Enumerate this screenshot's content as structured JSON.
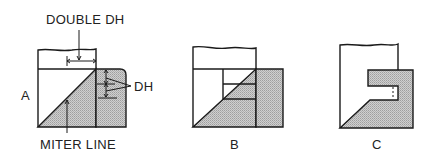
{
  "diagram": {
    "panels": [
      {
        "id": "A",
        "label": "A"
      },
      {
        "id": "B",
        "label": "B"
      },
      {
        "id": "C",
        "label": "C"
      }
    ],
    "annotations": {
      "double_dh": "DOUBLE DH",
      "dh": "DH",
      "miter_line": "MITER LINE"
    },
    "colors": {
      "line": "#1a1a1a",
      "shade": "#bdbdbd",
      "background": "#ffffff"
    }
  }
}
